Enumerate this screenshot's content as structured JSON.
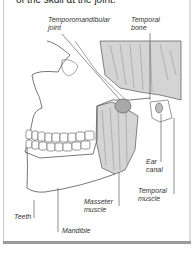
{
  "caption": "of the skull at the joint.",
  "labels": {
    "tmj_line1": "Temporomandibular",
    "tmj_line2": "joint",
    "temporal_bone_line1": "Temporal",
    "temporal_bone_line2": "bone",
    "ear_canal_line1": "Ear",
    "ear_canal_line2": "canal",
    "temporal_muscle_line1": "Temporal",
    "temporal_muscle_line2": "muscle",
    "masseter_line1": "Masseter",
    "masseter_line2": "muscle",
    "teeth": "Teeth",
    "mandible": "Mandible"
  },
  "colors": {
    "muscle_fill": "#d4d4d4",
    "line": "#555555",
    "border": "#c8c8c8",
    "shadow": "#9a9a9a"
  }
}
